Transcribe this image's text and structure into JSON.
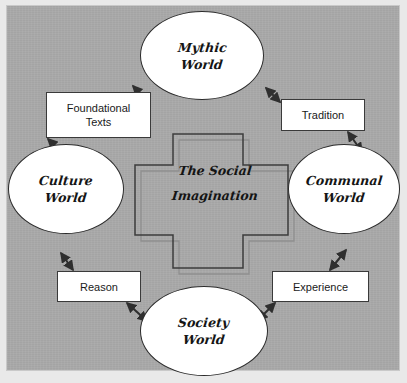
{
  "diagram": {
    "title": "The Social Imagination",
    "background_color": "#a9a9a9",
    "frame_color": "#c9c9c9",
    "node_fill": "#ffffff",
    "node_stroke": "#2b2b2b",
    "label_fill": "#ffffff",
    "label_stroke": "#3a3a3a",
    "arrow_color": "#2f2f2f",
    "cross_stroke": "#3c3c3c",
    "cross_shadow_stroke": "#8f8f8f"
  },
  "center": {
    "name": "center-cross",
    "line1": "The Social",
    "line2": "Imagination"
  },
  "nodes": [
    {
      "id": "mythic",
      "line1": "Mythic",
      "line2": "World",
      "position": "top"
    },
    {
      "id": "culture",
      "line1": "Culture",
      "line2": "World",
      "position": "left"
    },
    {
      "id": "communal",
      "line1": "Communal",
      "line2": "World",
      "position": "right"
    },
    {
      "id": "society",
      "line1": "Society",
      "line2": "World",
      "position": "bottom"
    }
  ],
  "edges": [
    {
      "id": "foundational",
      "line1": "Foundational",
      "line2": "Texts",
      "from": "culture",
      "to": "mythic",
      "bidirectional": true
    },
    {
      "id": "tradition",
      "line1": "Tradition",
      "line2": "",
      "from": "mythic",
      "to": "communal",
      "bidirectional": true
    },
    {
      "id": "reason",
      "line1": "Reason",
      "line2": "",
      "from": "society",
      "to": "culture",
      "bidirectional": true
    },
    {
      "id": "experience",
      "line1": "Experience",
      "line2": "",
      "from": "communal",
      "to": "society",
      "bidirectional": true
    }
  ]
}
